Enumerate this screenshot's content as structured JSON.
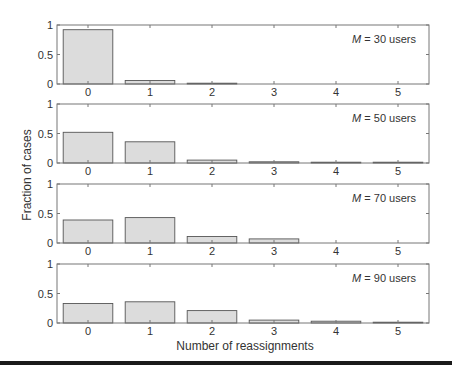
{
  "chart_data": [
    {
      "type": "bar",
      "title": "",
      "annotation": {
        "italic": "M",
        "text": " = 30 users"
      },
      "categories": [
        "0",
        "1",
        "2",
        "3",
        "4",
        "5"
      ],
      "values": [
        0.92,
        0.06,
        0.01,
        0.0,
        0.0,
        0.0
      ],
      "xlabel": "",
      "ylabel": "",
      "ylim": [
        0,
        1
      ],
      "yticks": [
        "0",
        "0.5",
        "1"
      ],
      "grid": false
    },
    {
      "type": "bar",
      "title": "",
      "annotation": {
        "italic": "M",
        "text": " = 50 users"
      },
      "categories": [
        "0",
        "1",
        "2",
        "3",
        "4",
        "5"
      ],
      "values": [
        0.52,
        0.36,
        0.05,
        0.02,
        0.005,
        0.005
      ],
      "xlabel": "",
      "ylabel": "Fraction of cases",
      "ylim": [
        0,
        1
      ],
      "yticks": [
        "0",
        "0.5",
        "1"
      ],
      "grid": false
    },
    {
      "type": "bar",
      "title": "",
      "annotation": {
        "italic": "M",
        "text": " = 70 users"
      },
      "categories": [
        "0",
        "1",
        "2",
        "3",
        "4",
        "5"
      ],
      "values": [
        0.39,
        0.43,
        0.11,
        0.07,
        0.0,
        0.0
      ],
      "xlabel": "",
      "ylabel": "",
      "ylim": [
        0,
        1
      ],
      "yticks": [
        "0",
        "0.5",
        "1"
      ],
      "grid": false
    },
    {
      "type": "bar",
      "title": "",
      "annotation": {
        "italic": "M",
        "text": " = 90 users"
      },
      "categories": [
        "0",
        "1",
        "2",
        "3",
        "4",
        "5"
      ],
      "values": [
        0.33,
        0.36,
        0.21,
        0.05,
        0.03,
        0.01
      ],
      "xlabel": "Number of reassignments",
      "ylabel": "",
      "ylim": [
        0,
        1
      ],
      "yticks": [
        "0",
        "0.5",
        "1"
      ],
      "grid": false
    }
  ],
  "figure": {
    "ylabel": "Fraction of cases",
    "xlabel": "Number of reassignments",
    "bar_fill": "#dcdcdc",
    "bar_stroke": "#555555",
    "axis_color": "#777777"
  }
}
